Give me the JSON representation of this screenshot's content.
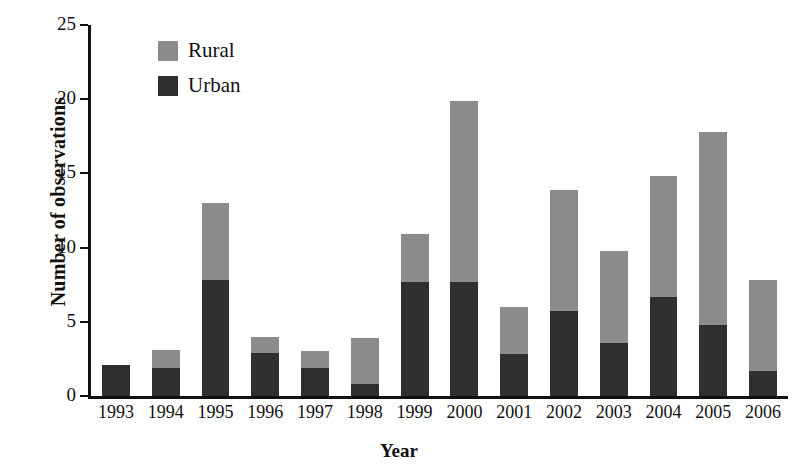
{
  "chart_data": {
    "type": "bar",
    "stacked": true,
    "title": "",
    "xlabel": "Year",
    "ylabel": "Number of observations",
    "categories": [
      "1993",
      "1994",
      "1995",
      "1996",
      "1997",
      "1998",
      "1999",
      "2000",
      "2001",
      "2002",
      "2003",
      "2004",
      "2005",
      "2006"
    ],
    "series": [
      {
        "name": "Urban",
        "color": "#2f2f2f",
        "values": [
          2.1,
          1.9,
          7.8,
          2.9,
          1.9,
          0.8,
          7.7,
          7.7,
          2.8,
          5.7,
          3.6,
          6.7,
          4.8,
          1.7
        ]
      },
      {
        "name": "Rural",
        "color": "#8c8c8c",
        "values": [
          0.0,
          1.2,
          5.2,
          1.1,
          1.1,
          3.1,
          3.2,
          12.2,
          3.2,
          8.2,
          6.2,
          8.1,
          13.0,
          6.1
        ]
      }
    ],
    "totals": [
      2.1,
      3.1,
      13.0,
      4.0,
      3.0,
      3.9,
      10.9,
      19.9,
      6.0,
      13.9,
      9.8,
      14.8,
      17.8,
      7.8
    ],
    "ylim": [
      0,
      25
    ],
    "yticks": [
      0,
      5,
      10,
      15,
      20,
      25
    ],
    "ytick_labels": [
      "0",
      "5",
      "10",
      "15",
      "20",
      "25"
    ],
    "grid": false,
    "legend_position": "top-left-inside"
  },
  "legend": {
    "items": [
      {
        "label": "Rural",
        "color": "#8c8c8c",
        "swatch_name": "rural-swatch"
      },
      {
        "label": "Urban",
        "color": "#2f2f2f",
        "swatch_name": "urban-swatch"
      }
    ]
  },
  "axes": {
    "y_title": "Number of observations",
    "x_title": "Year"
  }
}
